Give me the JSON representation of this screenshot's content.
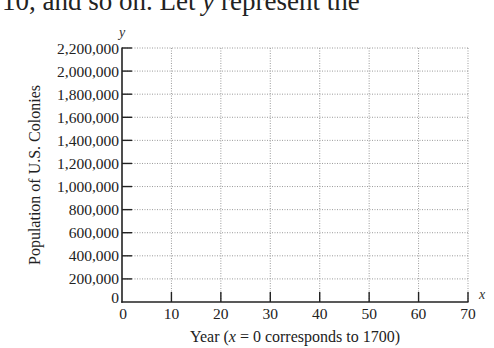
{
  "context_text": {
    "prefix": "10, and so on. Let ",
    "var": "y",
    "suffix": " represent the"
  },
  "chart_data": {
    "type": "line",
    "title": "",
    "xlabel": "Year (x = 0 corresponds to 1700)",
    "ylabel": "Population of U.S. Colonies",
    "x_axis_var": "x",
    "y_axis_var": "y",
    "xlim": [
      0,
      70
    ],
    "ylim": [
      0,
      2200000
    ],
    "x_ticks": [
      0,
      10,
      20,
      30,
      40,
      50,
      60,
      70
    ],
    "x_tick_labels": [
      "0",
      "10",
      "20",
      "30",
      "40",
      "50",
      "60",
      "70"
    ],
    "y_ticks": [
      0,
      200000,
      400000,
      600000,
      800000,
      1000000,
      1200000,
      1400000,
      1600000,
      1800000,
      2000000,
      2200000
    ],
    "y_tick_labels": [
      "0",
      "200,000",
      "400,000",
      "600,000",
      "800,000",
      "1,000,000",
      "1,200,000",
      "1,400,000",
      "1,600,000",
      "1,800,000",
      "2,000,000",
      "2,200,000"
    ],
    "grid": true,
    "grid_style": "dotted",
    "series": [],
    "legend": null
  },
  "labels": {
    "xlabel_prefix": "Year (",
    "xlabel_var": "x",
    "xlabel_suffix": " = 0 corresponds to 1700)"
  },
  "colors": {
    "axis": "#222222",
    "grid": "#9a9a9a",
    "text": "#222222"
  }
}
